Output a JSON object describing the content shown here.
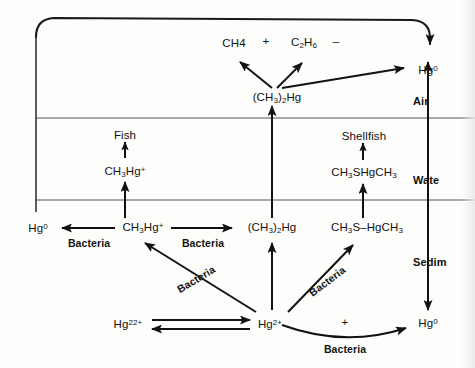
{
  "diagram": {
    "zones": [
      {
        "id": "air",
        "label": "Air"
      },
      {
        "id": "water",
        "label": "Wate"
      },
      {
        "id": "sediment",
        "label": "Sedim"
      }
    ],
    "species": {
      "methane": "CH4",
      "plus_sign": "+",
      "ethane": "C2H6",
      "minus_sign": "–",
      "dimethylmercury_air": "(CH3)2Hg",
      "dimethylmercury_sediment": "(CH3)2Hg",
      "mercury_zero_air": "Hg0",
      "mercury_zero_sediment_left": "Hg0",
      "mercury_zero_sediment_right": "Hg0",
      "methylmercury_water": "CH3Hg+",
      "methylmercury_sediment": "CH3Hg+",
      "fish": "Fish",
      "shellfish": "Shellfish",
      "dimethylthiomercury_water": "CH3SHgCH3",
      "dimethylthiomercury_sediment": "CH3S–HgCH3",
      "mercurous_ion": "Hg22+",
      "mercuric_ion": "Hg2+",
      "reaction_plus": "+"
    },
    "processes": {
      "bacteria_demethylation": "Bacteria",
      "bacteria_methylation": "Bacteria",
      "bacteria_methylation_left": "Bacteria",
      "bacteria_methylation_right": "Bacteria",
      "bacteria_reduction": "Bacteria"
    },
    "colors": {
      "ink": "#121212",
      "zone_rule": "#4a4a4a",
      "background": "#fdfdfb"
    }
  }
}
